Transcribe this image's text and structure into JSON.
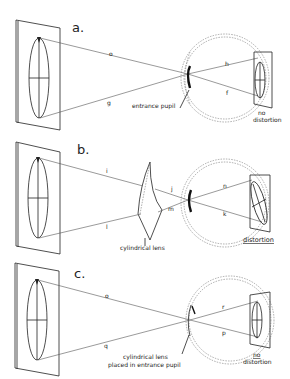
{
  "panels": [
    {
      "id": "a",
      "label": "a.",
      "ray_labels": {
        "top_object": "o",
        "bottom_object": "g",
        "top_image": "h",
        "bottom_image": "f"
      },
      "annotation": "entrance pupil",
      "result": "no distortion"
    },
    {
      "id": "b",
      "label": "b.",
      "ray_labels": {
        "top_object": "i",
        "bottom_object": "l",
        "top_mid": "j",
        "bottom_mid": "m",
        "top_image": "n",
        "bottom_image": "k"
      },
      "annotation": "cylindrical lens",
      "result": "distortion"
    },
    {
      "id": "c",
      "label": "c.",
      "ray_labels": {
        "top_object": "o",
        "bottom_object": "q",
        "top_image": "r",
        "bottom_image": "p"
      },
      "annotation_line1": "cylindrical lens",
      "annotation_line2": "placed in entrance pupil",
      "result_line1": "no",
      "result_line2": "distortion"
    }
  ]
}
